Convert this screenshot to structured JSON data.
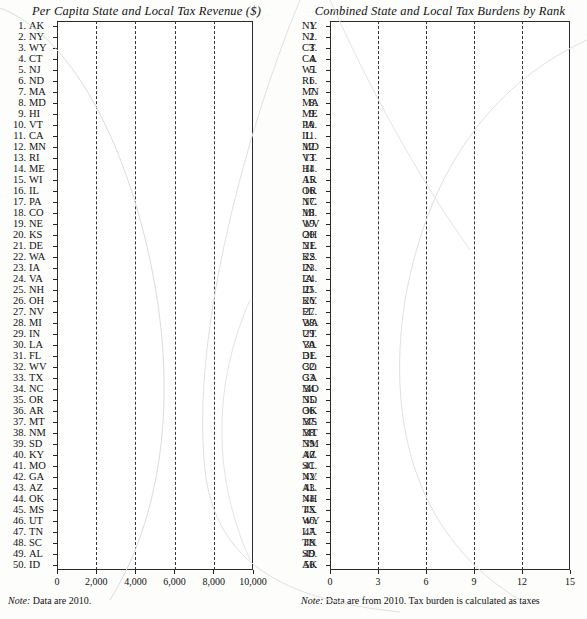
{
  "page": {
    "background": "#fdfdfc",
    "bar_dark_color": "#0b0b0b",
    "bar_light_color": "#b4b4b4"
  },
  "left_panel": {
    "title": "Per Capita State and Local Tax Revenue ($)",
    "note_prefix": "Note:",
    "note_text": " Data are 2010."
  },
  "right_panel": {
    "title": "Combined State and Local Tax Burdens by Rank",
    "note_prefix": "Note:",
    "note_text": " Data are from 2010. Tax burden is calculated as taxes"
  },
  "chart_data": [
    {
      "type": "bar",
      "orientation": "horizontal",
      "title": "Per Capita State and Local Tax Revenue ($)",
      "xlabel": "",
      "ylabel": "",
      "xlim": [
        0,
        10000
      ],
      "xticks": [
        0,
        2000,
        4000,
        6000,
        8000,
        10000
      ],
      "xtick_labels": [
        "0",
        "2,000",
        "4,000",
        "6,000",
        "8,000",
        "10,000"
      ],
      "grid": "vertical-dashed",
      "legend": "none",
      "note": "Note: Data are 2010.",
      "categories": [
        "AK",
        "NY",
        "WY",
        "CT",
        "NJ",
        "ND",
        "MA",
        "MD",
        "HI",
        "VT",
        "CA",
        "MN",
        "RI",
        "ME",
        "WI",
        "IL",
        "PA",
        "CO",
        "NE",
        "KS",
        "DE",
        "WA",
        "IA",
        "VA",
        "NH",
        "OH",
        "NV",
        "MI",
        "IN",
        "LA",
        "FL",
        "WV",
        "TX",
        "NC",
        "OR",
        "AR",
        "MT",
        "NM",
        "SD",
        "KY",
        "MO",
        "GA",
        "AZ",
        "OK",
        "MS",
        "UT",
        "TN",
        "SC",
        "AL",
        "ID"
      ],
      "ranks": [
        1,
        2,
        3,
        4,
        5,
        6,
        7,
        8,
        9,
        10,
        11,
        12,
        13,
        14,
        15,
        16,
        17,
        18,
        19,
        20,
        21,
        22,
        23,
        24,
        25,
        26,
        27,
        28,
        29,
        30,
        31,
        32,
        33,
        34,
        35,
        36,
        37,
        38,
        39,
        40,
        41,
        42,
        43,
        44,
        45,
        46,
        47,
        48,
        49,
        50
      ],
      "values": [
        9650,
        7000,
        6400,
        6000,
        5900,
        5350,
        5250,
        5100,
        4950,
        4900,
        4850,
        4800,
        4750,
        4700,
        4550,
        4500,
        4450,
        4400,
        4300,
        4280,
        4250,
        4200,
        4150,
        4100,
        4000,
        3980,
        3900,
        3880,
        3800,
        3780,
        3700,
        3680,
        3600,
        3550,
        3500,
        3450,
        3400,
        3380,
        3350,
        3300,
        3180,
        3150,
        3120,
        3100,
        3080,
        3060,
        2980,
        2950,
        2900,
        2880
      ]
    },
    {
      "type": "bar",
      "orientation": "horizontal",
      "title": "Combined State and Local Tax Burdens by Rank",
      "xlabel": "",
      "ylabel": "",
      "xlim": [
        0,
        15
      ],
      "xticks": [
        0,
        3,
        6,
        9,
        12,
        15
      ],
      "xtick_labels": [
        "0",
        "3",
        "6",
        "9",
        "12",
        "15"
      ],
      "grid": "vertical-dashed",
      "legend": "none",
      "note": "Note: Data are from 2010. Tax burden is calculated as taxes",
      "categories": [
        "NY",
        "NJ",
        "CT",
        "CA",
        "WI",
        "RI",
        "MN",
        "MA",
        "ME",
        "PA",
        "IL",
        "MD",
        "VT",
        "HI",
        "AR",
        "OR",
        "NC",
        "MI",
        "WV",
        "OH",
        "NE",
        "KS",
        "IN",
        "IA",
        "ID",
        "KY",
        "FL",
        "WA",
        "UT",
        "VA",
        "DE",
        "CO",
        "GA",
        "MO",
        "ND",
        "OK",
        "MS",
        "MT",
        "NM",
        "AZ",
        "SC",
        "NV",
        "AL",
        "NH",
        "TX",
        "WY",
        "LA",
        "TN",
        "SD",
        "AK"
      ],
      "ranks": [
        1,
        2,
        3,
        4,
        5,
        6,
        7,
        8,
        9,
        10,
        11,
        12,
        13,
        14,
        15,
        16,
        17,
        18,
        19,
        20,
        21,
        22,
        23,
        24,
        25,
        26,
        27,
        28,
        29,
        30,
        31,
        32,
        33,
        34,
        35,
        36,
        37,
        38,
        39,
        40,
        41,
        42,
        43,
        44,
        45,
        46,
        47,
        48,
        49,
        50
      ],
      "values": [
        12.5,
        12.2,
        12.0,
        11.4,
        11.2,
        10.9,
        10.7,
        10.4,
        10.3,
        10.2,
        10.15,
        10.1,
        10.05,
        10.0,
        9.9,
        9.8,
        9.75,
        9.7,
        9.6,
        9.55,
        9.5,
        9.45,
        9.4,
        9.35,
        9.3,
        9.25,
        9.2,
        9.15,
        9.1,
        9.05,
        9.0,
        8.95,
        8.9,
        8.85,
        8.8,
        8.6,
        8.5,
        8.4,
        8.3,
        8.25,
        8.2,
        8.15,
        8.1,
        8.0,
        7.9,
        7.8,
        7.75,
        7.7,
        7.6,
        7.0
      ]
    }
  ]
}
